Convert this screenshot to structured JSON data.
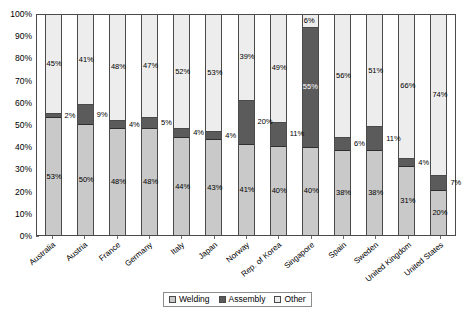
{
  "chart_data": {
    "type": "bar",
    "subtype": "stacked-bar-100-percent",
    "title": "",
    "xlabel": "",
    "ylabel": "",
    "ylim": [
      0,
      100
    ],
    "ytick_labels": [
      "0%",
      "10%",
      "20%",
      "30%",
      "40%",
      "50%",
      "60%",
      "70%",
      "80%",
      "90%",
      "100%"
    ],
    "ytick_values": [
      0,
      10,
      20,
      30,
      40,
      50,
      60,
      70,
      80,
      90,
      100
    ],
    "grid": false,
    "legend_position": "bottom-center",
    "categories": [
      "Australia",
      "Austria",
      "France",
      "Germany",
      "Italy",
      "Japan",
      "Norway",
      "Rep. of Korea",
      "Singapore",
      "Spain",
      "Sweden",
      "United Kingdom",
      "United States"
    ],
    "series": [
      {
        "name": "Welding",
        "color": "#c9c9c9",
        "values": [
          53,
          50,
          48,
          48,
          44,
          43,
          41,
          40,
          40,
          38,
          38,
          31,
          20
        ],
        "labels": [
          "53%",
          "50%",
          "48%",
          "48%",
          "44%",
          "43%",
          "41%",
          "40%",
          "40%",
          "38%",
          "38%",
          "31%",
          "20%"
        ]
      },
      {
        "name": "Assembly",
        "color": "#5b5b5b",
        "values": [
          2,
          9,
          4,
          5,
          4,
          4,
          20,
          11,
          55,
          6,
          11,
          4,
          7
        ],
        "labels": [
          "2%",
          "9%",
          "4%",
          "5%",
          "4%",
          "4%",
          "20%",
          "11%",
          "55%",
          "6%",
          "11%",
          "4%",
          "7%"
        ]
      },
      {
        "name": "Other",
        "color": "#ededed",
        "values": [
          45,
          41,
          48,
          47,
          52,
          53,
          39,
          49,
          6,
          56,
          51,
          66,
          74
        ],
        "labels": [
          "45%",
          "41%",
          "48%",
          "47%",
          "52%",
          "53%",
          "39%",
          "49%",
          "6%",
          "56%",
          "51%",
          "66%",
          "74%"
        ]
      }
    ]
  },
  "legend": {
    "items": [
      {
        "label": "Welding"
      },
      {
        "label": "Assembly"
      },
      {
        "label": "Other"
      }
    ]
  }
}
